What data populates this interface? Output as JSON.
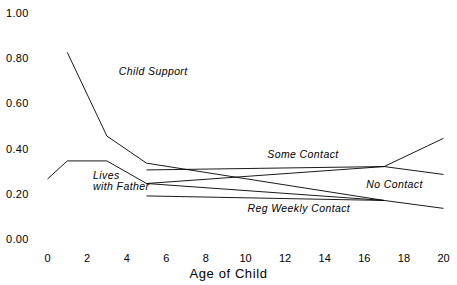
{
  "chart_data": {
    "type": "line",
    "title": "",
    "xlabel": "Age of Child",
    "ylabel": "",
    "xlim": [
      0,
      20
    ],
    "ylim": [
      0.0,
      1.0
    ],
    "grid": false,
    "legend_position": "inline-annotations",
    "x_ticks": [
      0,
      2,
      4,
      6,
      8,
      10,
      12,
      14,
      16,
      18,
      20
    ],
    "x_tick_labels": [
      "0",
      "2",
      "4",
      "6",
      "8",
      "10",
      "12",
      "14",
      "16",
      "18",
      "20"
    ],
    "y_ticks": [
      0.0,
      0.2,
      0.4,
      0.6,
      0.8,
      1.0
    ],
    "y_tick_labels": [
      "0.00",
      "0.20",
      "0.40",
      "0.60",
      "0.80",
      "1.00"
    ],
    "series": [
      {
        "name": "Child Support",
        "label": "Child Support",
        "color": "#000000",
        "x": [
          1,
          3,
          5,
          17
        ],
        "values": [
          0.83,
          0.46,
          0.34,
          0.175
        ]
      },
      {
        "name": "Lives with Father",
        "label": "Lives with Father",
        "color": "#000000",
        "x": [
          0,
          1,
          3,
          5,
          17
        ],
        "values": [
          0.27,
          0.35,
          0.35,
          0.25,
          0.175
        ]
      },
      {
        "name": "Some Contact",
        "label": "Some Contact",
        "color": "#000000",
        "x": [
          5,
          17,
          20
        ],
        "values": [
          0.31,
          0.325,
          0.45
        ]
      },
      {
        "name": "No Contact",
        "label": "No Contact",
        "color": "#000000",
        "x": [
          5,
          17,
          20
        ],
        "values": [
          0.25,
          0.325,
          0.29
        ]
      },
      {
        "name": "Reg Weekly Contact",
        "label": "Reg Weekly Contact",
        "color": "#000000",
        "x": [
          5,
          17,
          20
        ],
        "values": [
          0.195,
          0.175,
          0.14
        ]
      }
    ],
    "annotations": [
      {
        "text": "Child Support",
        "x": 3.6,
        "y": 0.745
      },
      {
        "text": "Lives",
        "x": 2.3,
        "y": 0.285
      },
      {
        "text": "with Father",
        "x": 2.3,
        "y": 0.235
      },
      {
        "text": "Some Contact",
        "x": 11.1,
        "y": 0.375
      },
      {
        "text": "No Contact",
        "x": 16.1,
        "y": 0.245
      },
      {
        "text": "Reg Weekly Contact",
        "x": 10.1,
        "y": 0.135
      }
    ]
  },
  "axes": {
    "x_axis_name": "x-axis",
    "y_axis_name": "y-axis"
  }
}
